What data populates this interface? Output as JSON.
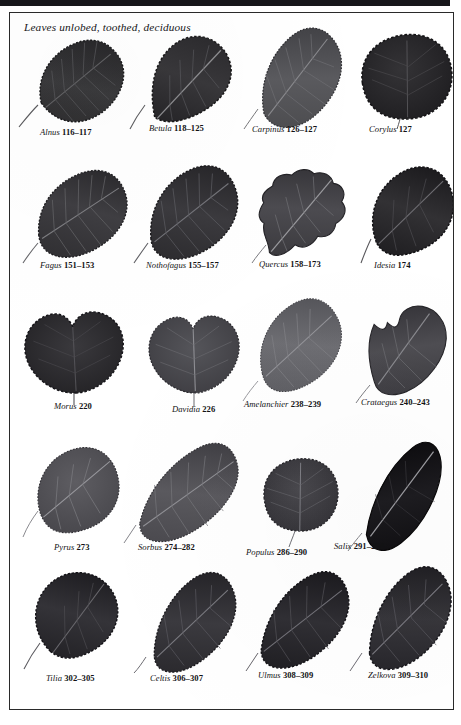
{
  "page": {
    "title": "Leaves unlobed, toothed, deciduous",
    "frame_color": "#2a2a2a",
    "top_bar_color": "#17161a",
    "background_color": "#ffffff"
  },
  "rows": [
    {
      "items": [
        {
          "genus": "Alnus",
          "pages": "116–117",
          "icon": "leaf-specimen-alnus"
        },
        {
          "genus": "Betula",
          "pages": "118–125",
          "icon": "leaf-specimen-betula"
        },
        {
          "genus": "Carpinus",
          "pages": "126–127",
          "icon": "leaf-specimen-carpinus"
        },
        {
          "genus": "Corylus",
          "pages": "127",
          "icon": "leaf-specimen-corylus"
        }
      ]
    },
    {
      "items": [
        {
          "genus": "Fagus",
          "pages": "151–153",
          "icon": "leaf-specimen-fagus"
        },
        {
          "genus": "Nothofagus",
          "pages": "155–157",
          "icon": "leaf-specimen-nothofagus"
        },
        {
          "genus": "Quercus",
          "pages": "158–173",
          "icon": "leaf-specimen-quercus"
        },
        {
          "genus": "Idesia",
          "pages": "174",
          "icon": "leaf-specimen-idesia"
        }
      ]
    },
    {
      "items": [
        {
          "genus": "Morus",
          "pages": "220",
          "icon": "leaf-specimen-morus"
        },
        {
          "genus": "Davidia",
          "pages": "226",
          "icon": "leaf-specimen-davidia"
        },
        {
          "genus": "Amelanchier",
          "pages": "238–239",
          "icon": "leaf-specimen-amelanchier"
        },
        {
          "genus": "Crataegus",
          "pages": "240–243",
          "icon": "leaf-specimen-crataegus"
        }
      ]
    },
    {
      "items": [
        {
          "genus": "Pyrus",
          "pages": "273",
          "icon": "leaf-specimen-pyrus"
        },
        {
          "genus": "Sorbus",
          "pages": "274–282",
          "icon": "leaf-specimen-sorbus"
        },
        {
          "genus": "Populus",
          "pages": "286–290",
          "icon": "leaf-specimen-populus"
        },
        {
          "genus": "Salix",
          "pages": "291–294",
          "icon": "leaf-specimen-salix"
        }
      ]
    },
    {
      "items": [
        {
          "genus": "Tilia",
          "pages": "302–305",
          "icon": "leaf-specimen-tilia"
        },
        {
          "genus": "Celtis",
          "pages": "306–307",
          "icon": "leaf-specimen-celtis"
        },
        {
          "genus": "Ulmus",
          "pages": "308–309",
          "icon": "leaf-specimen-ulmus"
        },
        {
          "genus": "Zelkova",
          "pages": "309–310",
          "icon": "leaf-specimen-zelkova"
        }
      ]
    }
  ]
}
